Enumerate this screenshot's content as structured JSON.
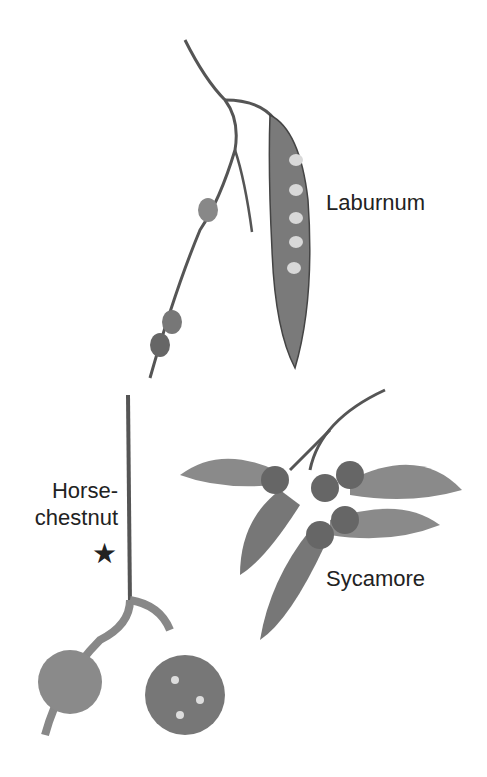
{
  "labels": {
    "laburnum": "Laburnum",
    "horse_chestnut_line1": "Horse-",
    "horse_chestnut_line2": "chestnut",
    "star": "★",
    "sycamore": "Sycamore"
  },
  "illustrations": [
    {
      "name": "laburnum-twig",
      "description": "twig with seed pod"
    },
    {
      "name": "horse-chestnut-twig",
      "description": "twig with two spiky fruits"
    },
    {
      "name": "sycamore-fruits",
      "description": "winged sycamore keys"
    }
  ]
}
